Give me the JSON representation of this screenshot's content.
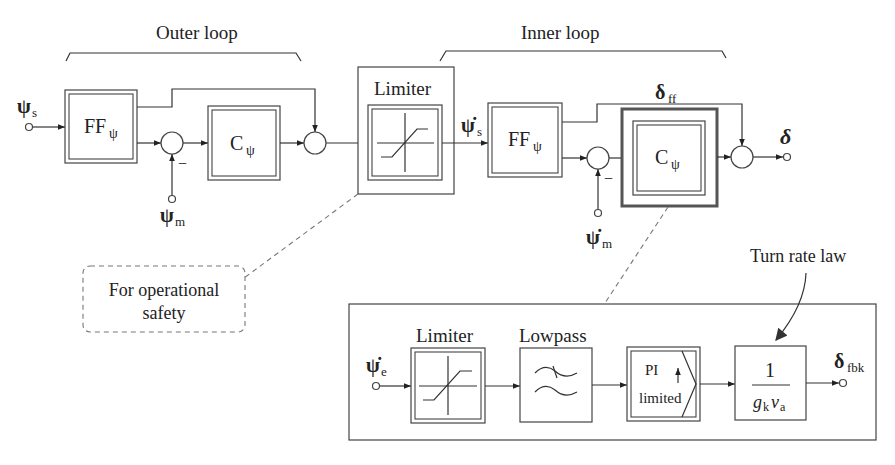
{
  "diagram": {
    "type": "control-block-diagram",
    "groups": {
      "outer_loop": "Outer loop",
      "inner_loop": "Inner loop"
    },
    "signals": {
      "psi_s": {
        "sym": "ψ",
        "sub": "s"
      },
      "psi_m": {
        "sym": "ψ",
        "sub": "m"
      },
      "psidot_s": {
        "sym": "ψ̇",
        "sub": "s"
      },
      "psidot_m": {
        "sym": "ψ̇",
        "sub": "m"
      },
      "psidot_e": {
        "sym": "ψ̇",
        "sub": "e"
      },
      "delta_ff": {
        "sym": "δ",
        "sub": "ff"
      },
      "delta": {
        "sym": "δ"
      },
      "delta_fbk": {
        "sym": "δ",
        "sub": "fbk"
      }
    },
    "blocks": {
      "outer_ff": {
        "main": "FF",
        "sub": "ψ"
      },
      "outer_c": {
        "main": "C",
        "sub": "ψ"
      },
      "limiter_top": {
        "title": "Limiter"
      },
      "inner_ff": {
        "main": "FF",
        "sub": "ψ"
      },
      "inner_c": {
        "main": "C",
        "sub": "ψ"
      },
      "limiter_bottom": {
        "title": "Limiter"
      },
      "lowpass": {
        "title": "Lowpass"
      },
      "pi_limited": {
        "line1": "PI",
        "line2": "limited"
      },
      "turn_rate": {
        "numerator": "1",
        "den_g": "g",
        "den_g_sub": "k",
        "den_v": "v",
        "den_v_sub": "a"
      }
    },
    "minus_sign": "−",
    "annotations": {
      "safety_note_line1": "For operational",
      "safety_note_line2": "safety",
      "turn_rate_law": "Turn rate law"
    }
  }
}
